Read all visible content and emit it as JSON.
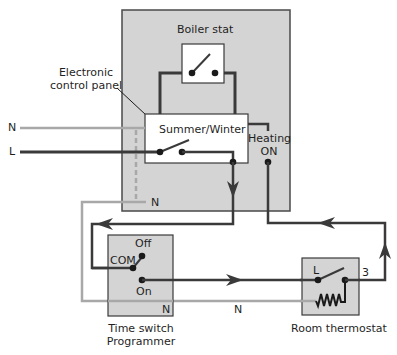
{
  "colors": {
    "panel_fill": "#d4d4d4",
    "panel_stroke": "#4a4a4a",
    "live_wire": "#3a3a3a",
    "neutral_wire": "#a8a8a8",
    "box_fill": "#ffffff"
  },
  "labels": {
    "boiler_stat": "Boiler stat",
    "control_panel_line1": "Electronic",
    "control_panel_line2": "control panel",
    "n_input": "N",
    "l_input": "L",
    "summer_winter": "Summer/Winter",
    "heating_line1": "Heating",
    "heating_line2": "ON",
    "panel_n": "N",
    "off": "Off",
    "com": "COM",
    "on": "On",
    "timeswitch_n": "N",
    "wire_n": "N",
    "time_switch_line1": "Time switch",
    "time_switch_line2": "Programmer",
    "thermostat_l": "L",
    "thermostat_3": "3",
    "room_thermostat": "Room thermostat"
  }
}
